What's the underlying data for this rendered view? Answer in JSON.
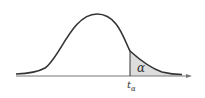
{
  "diagram": {
    "type": "t-distribution right-tail area",
    "area_label": "α",
    "critical_value_label": "t",
    "critical_value_subscript": "α",
    "colors": {
      "curve": "#333333",
      "axis": "#666666",
      "shade": "#dddddd"
    }
  }
}
